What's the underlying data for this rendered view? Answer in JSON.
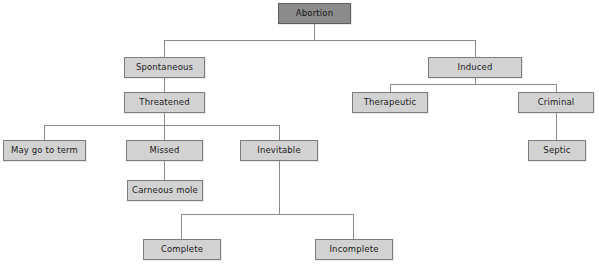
{
  "diagram": {
    "type": "tree-flowchart",
    "colors": {
      "background": "#ffffff",
      "node_fill": "#d2d2d2",
      "node_border": "#7d7d7d",
      "root_fill": "#8b8b8b",
      "root_border": "#5e5e5e",
      "connector": "#8a8a8a",
      "text": "#1b1b1b"
    },
    "nodes": [
      {
        "id": "abortion",
        "label": "Abortion",
        "level": 0,
        "x": 278,
        "y": 3,
        "w": 73,
        "h": 21,
        "variant": "root"
      },
      {
        "id": "spontaneous",
        "label": "Spontaneous",
        "level": 1,
        "x": 124,
        "y": 57,
        "w": 81,
        "h": 21,
        "variant": "normal"
      },
      {
        "id": "induced",
        "label": "Induced",
        "level": 1,
        "x": 428,
        "y": 57,
        "w": 94,
        "h": 21,
        "variant": "normal"
      },
      {
        "id": "threatened",
        "label": "Threatened",
        "level": 2,
        "x": 124,
        "y": 92,
        "w": 81,
        "h": 21,
        "variant": "normal"
      },
      {
        "id": "therapeutic",
        "label": "Therapeutic",
        "level": 2,
        "x": 352,
        "y": 92,
        "w": 76,
        "h": 21,
        "variant": "normal"
      },
      {
        "id": "criminal",
        "label": "Criminal",
        "level": 2,
        "x": 518,
        "y": 92,
        "w": 76,
        "h": 21,
        "variant": "normal"
      },
      {
        "id": "may-go-to-term",
        "label": "May go to term",
        "level": 3,
        "x": 3,
        "y": 140,
        "w": 83,
        "h": 21,
        "variant": "normal"
      },
      {
        "id": "missed",
        "label": "Missed",
        "level": 3,
        "x": 126,
        "y": 140,
        "w": 77,
        "h": 21,
        "variant": "normal"
      },
      {
        "id": "inevitable",
        "label": "Inevitable",
        "level": 3,
        "x": 240,
        "y": 140,
        "w": 78,
        "h": 21,
        "variant": "normal"
      },
      {
        "id": "septic",
        "label": "Septic",
        "level": 3,
        "x": 528,
        "y": 140,
        "w": 58,
        "h": 21,
        "variant": "normal"
      },
      {
        "id": "carneous-mole",
        "label": "Carneous mole",
        "level": 4,
        "x": 127,
        "y": 180,
        "w": 76,
        "h": 21,
        "variant": "normal"
      },
      {
        "id": "complete",
        "label": "Complete",
        "level": 5,
        "x": 143,
        "y": 239,
        "w": 78,
        "h": 21,
        "variant": "normal"
      },
      {
        "id": "incomplete",
        "label": "Incomplete",
        "level": 5,
        "x": 315,
        "y": 239,
        "w": 78,
        "h": 21,
        "variant": "normal"
      }
    ],
    "edges": [
      {
        "from": "abortion",
        "to": "spontaneous"
      },
      {
        "from": "abortion",
        "to": "induced"
      },
      {
        "from": "spontaneous",
        "to": "threatened"
      },
      {
        "from": "induced",
        "to": "therapeutic"
      },
      {
        "from": "induced",
        "to": "criminal"
      },
      {
        "from": "threatened",
        "to": "may-go-to-term"
      },
      {
        "from": "threatened",
        "to": "missed"
      },
      {
        "from": "threatened",
        "to": "inevitable"
      },
      {
        "from": "criminal",
        "to": "septic"
      },
      {
        "from": "missed",
        "to": "carneous-mole"
      },
      {
        "from": "inevitable",
        "to": "complete"
      },
      {
        "from": "inevitable",
        "to": "incomplete"
      }
    ],
    "connector_paths": [
      {
        "name": "abortion-stem",
        "d": "M314.5 24 L314.5 40"
      },
      {
        "name": "abortion-bus",
        "d": "M164.5 40 L475.5 40"
      },
      {
        "name": "abortion-to-spontaneous",
        "d": "M164.5 40 L164.5 57"
      },
      {
        "name": "abortion-to-induced",
        "d": "M475.5 40 L475.5 57"
      },
      {
        "name": "spontaneous-to-threatened",
        "d": "M164.5 78 L164.5 92"
      },
      {
        "name": "induced-stem",
        "d": "M475.5 78 L475.5 84"
      },
      {
        "name": "induced-bus",
        "d": "M390.5 84 L556.5 84"
      },
      {
        "name": "induced-to-therapeutic",
        "d": "M390.5 84 L390.5 92"
      },
      {
        "name": "induced-to-criminal",
        "d": "M556.5 84 L556.5 92"
      },
      {
        "name": "criminal-to-septic",
        "d": "M556.5 113 L556.5 140"
      },
      {
        "name": "threatened-stem",
        "d": "M164.5 113 L164.5 125"
      },
      {
        "name": "threatened-bus",
        "d": "M44.5 125 L279.5 125"
      },
      {
        "name": "threatened-to-may",
        "d": "M44.5 125 L44.5 140"
      },
      {
        "name": "threatened-to-missed",
        "d": "M164.5 125 L164.5 140"
      },
      {
        "name": "threatened-to-inevitable",
        "d": "M279.5 125 L279.5 140"
      },
      {
        "name": "missed-to-carneous",
        "d": "M164.5 161 L164.5 180"
      },
      {
        "name": "inevitable-stem",
        "d": "M279.5 161 L279.5 214"
      },
      {
        "name": "inevitable-bus",
        "d": "M181.5 214 L353.5 214"
      },
      {
        "name": "inevitable-to-complete",
        "d": "M181.5 214 L181.5 239"
      },
      {
        "name": "inevitable-to-incomplete",
        "d": "M353.5 214 L353.5 239"
      }
    ]
  }
}
